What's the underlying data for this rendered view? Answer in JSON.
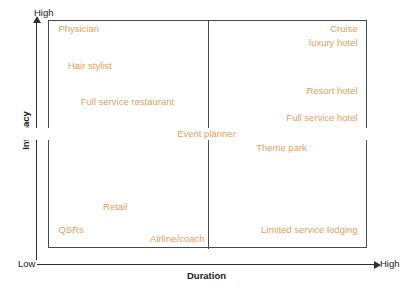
{
  "chart_data": {
    "type": "scatter",
    "title": "",
    "xlabel": "Duration",
    "ylabel": "Intimacy",
    "x_low_label": "Low",
    "x_high_label": "High",
    "y_low_label": "",
    "y_high_label": "High",
    "grid": true,
    "legend": "none",
    "axis_note": "2x2 positioning matrix; axes qualitative Low-to-High; quadrant dividers at midpoints",
    "xlim": [
      "Low",
      "High"
    ],
    "ylim": [
      "Low",
      "High"
    ],
    "quadrants": [
      "high-intimacy / low-duration",
      "high-intimacy / high-duration",
      "low-intimacy / low-duration",
      "low-intimacy / high-duration"
    ],
    "points": [
      {
        "label": "Physician",
        "x": 0.02,
        "y": 0.96,
        "quadrant": "high-intimacy / low-duration",
        "align": "left"
      },
      {
        "label": "Hair stylist",
        "x": 0.05,
        "y": 0.8,
        "quadrant": "high-intimacy / low-duration",
        "align": "left"
      },
      {
        "label": "Full service restaurant",
        "x": 0.09,
        "y": 0.64,
        "quadrant": "high-intimacy / low-duration",
        "align": "left"
      },
      {
        "label": "Cruise",
        "x": 0.98,
        "y": 0.96,
        "quadrant": "high-intimacy / high-duration",
        "align": "right"
      },
      {
        "label": "luxury hotel",
        "x": 0.98,
        "y": 0.9,
        "quadrant": "high-intimacy / high-duration",
        "align": "right"
      },
      {
        "label": "Resort hotel",
        "x": 0.98,
        "y": 0.69,
        "quadrant": "high-intimacy / high-duration",
        "align": "right"
      },
      {
        "label": "Full service hotel",
        "x": 0.98,
        "y": 0.57,
        "quadrant": "high-intimacy / high-duration",
        "align": "right"
      },
      {
        "label": "Event planner",
        "x": 0.5,
        "y": 0.5,
        "quadrant": "center",
        "align": "center"
      },
      {
        "label": "Theme park",
        "x": 0.64,
        "y": 0.44,
        "quadrant": "low-intimacy / high-duration",
        "align": "left"
      },
      {
        "label": "Retail",
        "x": 0.16,
        "y": 0.18,
        "quadrant": "low-intimacy / low-duration",
        "align": "left"
      },
      {
        "label": "QSRs",
        "x": 0.02,
        "y": 0.08,
        "quadrant": "low-intimacy / low-duration",
        "align": "left"
      },
      {
        "label": "Airline/coach",
        "x": 0.5,
        "y": 0.04,
        "quadrant": "low-intimacy / low-duration",
        "align": "right"
      },
      {
        "label": "Limited service lodging",
        "x": 0.98,
        "y": 0.08,
        "quadrant": "low-intimacy / high-duration",
        "align": "right"
      }
    ]
  },
  "colors": {
    "label_text": "#E8A05A",
    "axis_line": "#2F2F2F",
    "box_line": "#4A4A4A",
    "axis_title_text": "#1A1A1A",
    "background": "#FFFFFF"
  },
  "axes": {
    "y_title": "Intimacy",
    "x_title": "Duration",
    "y_top_label": "High",
    "x_left_label": "Low",
    "x_right_label": "High"
  },
  "labels": {
    "physician": "Physician",
    "hair_stylist": "Hair stylist",
    "full_service_restaurant": "Full service restaurant",
    "cruise": "Cruise",
    "luxury_hotel": "luxury hotel",
    "resort_hotel": "Resort hotel",
    "full_service_hotel": "Full service hotel",
    "event_planner": "Event planner",
    "theme_park": "Theme park",
    "retail": "Retail",
    "qsrs": "QSRs",
    "airline_coach": "Airline/coach",
    "limited_service_lodging": "Limited service lodging"
  }
}
